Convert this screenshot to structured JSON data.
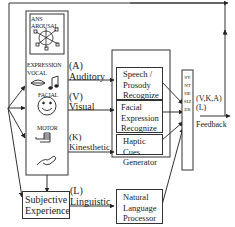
{
  "diagram": {
    "modalities_panel": {
      "ans_arousal": [
        "ANS",
        "AROUSAL"
      ],
      "expression_label": "EXPRESSION",
      "vocal_label": "VOCAL",
      "facial_label": "FACIAL",
      "motor_label": "MOTOR"
    },
    "channels": [
      {
        "code": "(A)",
        "name": "Auditory"
      },
      {
        "code": "(V)",
        "name": "Visual"
      },
      {
        "code": "(K)",
        "name": "Kinesthetic"
      },
      {
        "code": "(L)",
        "name": "Linguistic"
      }
    ],
    "subjective_experience": [
      "Subjective",
      "Experience"
    ],
    "processors": [
      {
        "lines": [
          "Speech /",
          "Prosody",
          "Recognize"
        ]
      },
      {
        "lines": [
          "Facial",
          "Expression",
          "Recognize"
        ]
      },
      {
        "lines": [
          "Haptic",
          "Cues",
          "Generator"
        ]
      },
      {
        "lines": [
          "Natural",
          "Language",
          "Processor"
        ]
      }
    ],
    "synthesizer": "SYNTHESIZER",
    "output_label": [
      "(V,K,A)",
      "(L)"
    ],
    "feedback_label": "Feedback",
    "icons": [
      "arousal-network-icon",
      "lips-icon",
      "music-note-icon",
      "smiley-face-icon",
      "fist-hand-icon",
      "pointing-hand-icon"
    ]
  }
}
